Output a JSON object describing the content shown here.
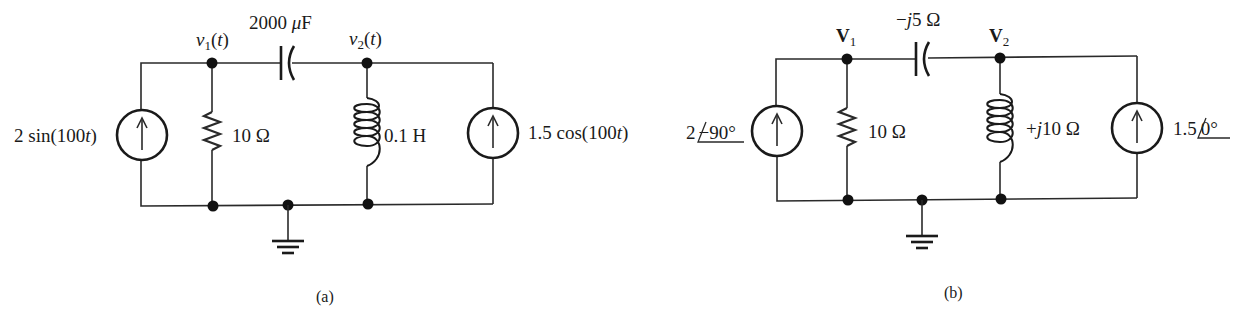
{
  "diagram": {
    "type": "circuit-schematic",
    "panels": [
      {
        "id": "a",
        "caption": "(a)",
        "domain": "time",
        "nodes": {
          "v1": {
            "symbol": "v",
            "subscript": "1",
            "suffix": "(t)"
          },
          "v2": {
            "symbol": "v",
            "subscript": "2",
            "suffix": "(t)"
          }
        },
        "components": {
          "source_left": {
            "kind": "current-source",
            "label_pre": "2 sin(100",
            "label_var": "t",
            "label_post": ")"
          },
          "resistor": {
            "kind": "resistor",
            "label": "10 Ω"
          },
          "capacitor": {
            "kind": "capacitor",
            "label_num": "2000 ",
            "label_unit_mu": "μ",
            "label_unit": "F"
          },
          "inductor": {
            "kind": "inductor",
            "label": "0.1 H"
          },
          "source_right": {
            "kind": "current-source",
            "label_pre": "1.5 cos(100",
            "label_var": "t",
            "label_post": ")"
          }
        },
        "ground": true
      },
      {
        "id": "b",
        "caption": "(b)",
        "domain": "phasor",
        "nodes": {
          "V1": {
            "symbol": "V",
            "subscript": "1"
          },
          "V2": {
            "symbol": "V",
            "subscript": "2"
          }
        },
        "components": {
          "source_left": {
            "kind": "current-source",
            "magnitude": "2",
            "angle": "−90°"
          },
          "resistor": {
            "kind": "resistor",
            "label": "10 Ω"
          },
          "capacitor": {
            "kind": "capacitor",
            "label_pre": "−",
            "label_j": "j",
            "label_post": "5 Ω"
          },
          "inductor": {
            "kind": "inductor",
            "label_pre": "+",
            "label_j": "j",
            "label_post": "10 Ω"
          },
          "source_right": {
            "kind": "current-source",
            "magnitude": "1.5",
            "angle": "0°"
          }
        },
        "ground": true
      }
    ]
  }
}
